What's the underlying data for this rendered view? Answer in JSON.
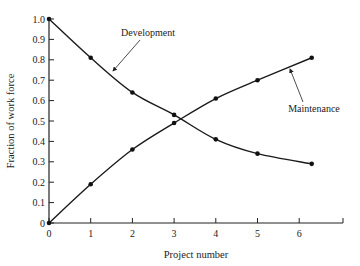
{
  "chart_data": {
    "type": "line",
    "title": "",
    "xlabel": "Project number",
    "ylabel": "Fraction of work force",
    "xlim": [
      0,
      7
    ],
    "ylim": [
      0,
      1.0
    ],
    "grid": false,
    "legend": "inline annotations with leader arrows",
    "x_ticks": [
      "0",
      "1",
      "2",
      "3",
      "4",
      "5",
      "6"
    ],
    "y_ticks": [
      "0",
      "0.1",
      "0.2",
      "0.3",
      "0.4",
      "0.5",
      "0.6",
      "0.7",
      "0.8",
      "0.9",
      "1.0"
    ],
    "series": [
      {
        "name": "Development",
        "x": [
          0,
          1,
          2,
          3,
          4,
          5,
          6.3
        ],
        "values": [
          1.0,
          0.81,
          0.64,
          0.53,
          0.41,
          0.34,
          0.29
        ]
      },
      {
        "name": "Maintenance",
        "x": [
          0,
          1,
          2,
          3,
          4,
          5,
          6.3
        ],
        "values": [
          0.0,
          0.19,
          0.36,
          0.49,
          0.61,
          0.7,
          0.81
        ]
      }
    ],
    "annotations": [
      {
        "text": "Development",
        "points_to_series": "Development"
      },
      {
        "text": "Maintenance",
        "points_to_series": "Maintenance"
      }
    ]
  }
}
